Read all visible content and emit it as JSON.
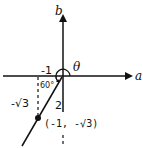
{
  "diagram": {
    "axes": {
      "horizontal_label": "a",
      "vertical_label": "b"
    },
    "angle_label": "θ",
    "inner_angle_label": "60°",
    "x_tick_label": "-1",
    "y_segment_label": "-√3",
    "hypotenuse_label": "2",
    "point": {
      "label": "(-1, -√3)",
      "x": -1,
      "y": "-√3"
    },
    "colors": {
      "stroke": "#111111",
      "background": "#ffffff"
    }
  }
}
